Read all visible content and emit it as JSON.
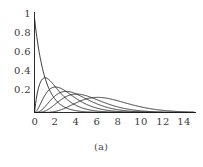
{
  "figure": {
    "caption": "(a)",
    "background_color": "#ffffff",
    "curve_color": "#1f1f1f",
    "axis_color": "#2b2b2b",
    "tick_label_color": "#3a3a3a"
  },
  "chart_data": {
    "type": "line",
    "title": "",
    "subtitle": "",
    "xlabel": "",
    "ylabel": "",
    "caption": "(a)",
    "grid": false,
    "legend": false,
    "legend_position": "none",
    "xlim": [
      0,
      15.2
    ],
    "ylim": [
      0,
      1.05
    ],
    "xticks": [
      0,
      2,
      4,
      6,
      8,
      10,
      12,
      14
    ],
    "xtick_labels": [
      "0",
      "2",
      "4",
      "6",
      "8",
      "10",
      "12",
      "14"
    ],
    "yticks": [
      0.2,
      0.4,
      0.6,
      0.8,
      1
    ],
    "ytick_labels": [
      "0.2",
      "0.4",
      "0.6",
      "0.8",
      "1"
    ],
    "series": [
      {
        "name": "k=1",
        "shape": 1,
        "scale": 1,
        "peak_x": 0.0,
        "peak_y": 1.0,
        "x": [
          0,
          0.15,
          0.3,
          0.5,
          0.75,
          1,
          1.5,
          2,
          2.5,
          3,
          4,
          5,
          6,
          7,
          8,
          9,
          10,
          11,
          12,
          13,
          14,
          15
        ],
        "y": [
          1.0,
          0.861,
          0.741,
          0.607,
          0.472,
          0.368,
          0.223,
          0.135,
          0.082,
          0.05,
          0.018,
          0.007,
          0.002,
          0.001,
          0.0,
          0.0,
          0.0,
          0.0,
          0.0,
          0.0,
          0.0,
          0.0
        ]
      },
      {
        "name": "k=2",
        "shape": 2,
        "scale": 1,
        "peak_x": 1.0,
        "peak_y": 0.368,
        "x": [
          0,
          0.25,
          0.5,
          0.75,
          1,
          1.5,
          2,
          2.5,
          3,
          4,
          5,
          6,
          7,
          8,
          9,
          10,
          11,
          12,
          13,
          14,
          15
        ],
        "y": [
          0.0,
          0.195,
          0.303,
          0.354,
          0.368,
          0.335,
          0.271,
          0.205,
          0.149,
          0.073,
          0.034,
          0.015,
          0.006,
          0.003,
          0.001,
          0.0,
          0.0,
          0.0,
          0.0,
          0.0,
          0.0
        ]
      },
      {
        "name": "k=3",
        "shape": 3,
        "scale": 1,
        "peak_x": 2.0,
        "peak_y": 0.271,
        "x": [
          0,
          0.5,
          1,
          1.5,
          2,
          2.5,
          3,
          3.5,
          4,
          5,
          6,
          7,
          8,
          9,
          10,
          11,
          12,
          13,
          14,
          15
        ],
        "y": [
          0.0,
          0.076,
          0.184,
          0.251,
          0.271,
          0.257,
          0.224,
          0.185,
          0.147,
          0.084,
          0.045,
          0.022,
          0.011,
          0.005,
          0.002,
          0.001,
          0.0,
          0.0,
          0.0,
          0.0
        ]
      },
      {
        "name": "k=4",
        "shape": 4,
        "scale": 1,
        "peak_x": 3.0,
        "peak_y": 0.224,
        "x": [
          0,
          0.5,
          1,
          1.5,
          2,
          3,
          4,
          5,
          6,
          7,
          8,
          9,
          10,
          11,
          12,
          13,
          14,
          15
        ],
        "y": [
          0.0,
          0.013,
          0.061,
          0.126,
          0.18,
          0.224,
          0.195,
          0.14,
          0.089,
          0.052,
          0.029,
          0.015,
          0.008,
          0.004,
          0.002,
          0.001,
          0.0,
          0.0
        ]
      },
      {
        "name": "k=5",
        "shape": 5,
        "scale": 1,
        "peak_x": 4.0,
        "peak_y": 0.195,
        "x": [
          0,
          1,
          2,
          3,
          4,
          5,
          6,
          7,
          8,
          9,
          10,
          11,
          12,
          13,
          14,
          15
        ],
        "y": [
          0.0,
          0.015,
          0.09,
          0.168,
          0.195,
          0.175,
          0.134,
          0.091,
          0.057,
          0.034,
          0.019,
          0.01,
          0.005,
          0.003,
          0.001,
          0.001
        ]
      },
      {
        "name": "k=7",
        "shape": 7,
        "scale": 1,
        "peak_x": 6.0,
        "peak_y": 0.149,
        "x": [
          0,
          1,
          2,
          3,
          4,
          5,
          6,
          7,
          8,
          9,
          10,
          11,
          12,
          13,
          14,
          15
        ],
        "y": [
          0.0,
          0.0005,
          0.012,
          0.05,
          0.104,
          0.146,
          0.161,
          0.149,
          0.123,
          0.092,
          0.063,
          0.041,
          0.025,
          0.015,
          0.008,
          0.004
        ]
      }
    ]
  }
}
